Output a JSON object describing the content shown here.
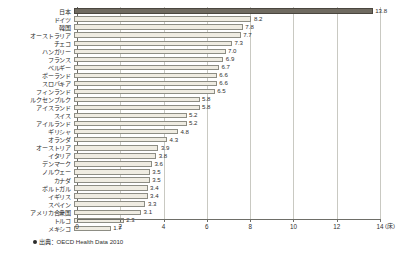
{
  "chart_data": {
    "type": "bar",
    "orientation": "horizontal",
    "title": "",
    "xlabel": "(床)",
    "ylabel": "",
    "xlim": [
      0,
      14
    ],
    "xticks": [
      0,
      2,
      4,
      6,
      8,
      10,
      12,
      14
    ],
    "xtick_labels": [
      "0",
      "2",
      "4",
      "6",
      "8",
      "10",
      "12",
      "14"
    ],
    "grid": true,
    "legend": false,
    "highlight_category": "日本",
    "source_note": "出典：OECD Health Data 2010",
    "source_bullet": "bullet-marker",
    "categories": [
      "日本",
      "ドイツ",
      "韓国",
      "オーストラリア",
      "チェコ",
      "ハンガリー",
      "フランス",
      "ベルギー",
      "ポーランド",
      "スロバキア",
      "フィンランド",
      "ルクセンブルク",
      "アイスランド",
      "スイス",
      "アイルランド",
      "ギリシャ",
      "オランダ",
      "オーストリア",
      "イタリア",
      "デンマーク",
      "ノルウェー",
      "カナダ",
      "ポルトガル",
      "イギリス",
      "スペイン",
      "アメリカ合衆国",
      "トルコ",
      "メキシコ"
    ],
    "values": [
      13.8,
      8.2,
      7.8,
      7.7,
      7.3,
      7.0,
      6.9,
      6.7,
      6.6,
      6.6,
      6.5,
      5.8,
      5.8,
      5.2,
      5.2,
      4.8,
      4.3,
      3.9,
      3.8,
      3.6,
      3.5,
      3.5,
      3.4,
      3.4,
      3.3,
      3.1,
      2.3,
      1.7
    ],
    "value_labels": [
      "13.8",
      "8.2",
      "7.8",
      "7.7",
      "7.3",
      "7.0",
      "6.9",
      "6.7",
      "6.6",
      "6.6",
      "6.5",
      "5.8",
      "5.8",
      "5.2",
      "5.2",
      "4.8",
      "4.3",
      "3.9",
      "3.8",
      "3.6",
      "3.5",
      "3.5",
      "3.4",
      "3.4",
      "3.3",
      "3.1",
      "2.3",
      "1.7"
    ],
    "colors": {
      "bar_fill": "#efece2",
      "bar_stroke": "#8d8d84",
      "highlight_fill": "#6f6a60",
      "highlight_stroke": "#4a463f",
      "grid": "#c9c9c2",
      "axis": "#6e6e68",
      "text": "#2f2f2f",
      "background": "#ffffff"
    }
  }
}
